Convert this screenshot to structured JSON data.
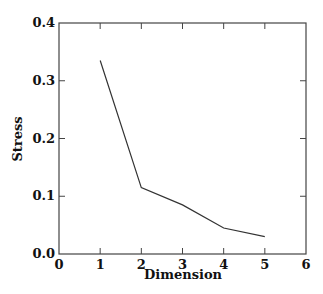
{
  "chart_data": {
    "type": "line",
    "title": "",
    "xlabel": "Dimension",
    "ylabel": "Stress",
    "xlim": [
      0,
      6
    ],
    "ylim": [
      0.0,
      0.4
    ],
    "x_ticks": [
      "0",
      "1",
      "2",
      "3",
      "4",
      "5",
      "6"
    ],
    "y_ticks": [
      "0.0",
      "0.1",
      "0.2",
      "0.3",
      "0.4"
    ],
    "grid": false,
    "legend": null,
    "series": [
      {
        "name": "Stress",
        "x": [
          1,
          2,
          3,
          4,
          5
        ],
        "values": [
          0.335,
          0.115,
          0.085,
          0.045,
          0.03
        ]
      }
    ]
  },
  "style": {
    "line_color": "#333333",
    "axis_color": "#444444"
  }
}
